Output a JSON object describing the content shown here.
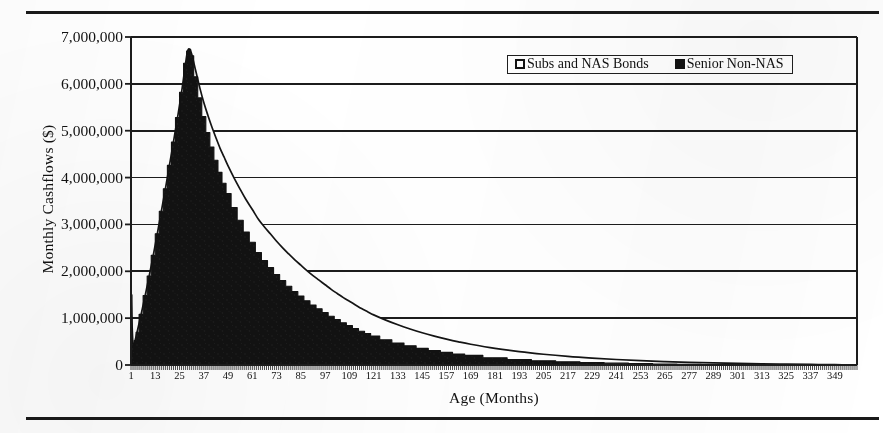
{
  "figure": {
    "rules": [
      "top-rule",
      "bottom-rule"
    ]
  },
  "legend": {
    "position": "inside-top-right",
    "entries": [
      {
        "label": "Subs and NAS Bonds",
        "swatch": "hollow-square-icon",
        "color": "#ffffff"
      },
      {
        "label": "Senior Non-NAS",
        "swatch": "filled-square-icon",
        "color": "#121212"
      }
    ]
  },
  "chart_data": {
    "type": "area",
    "stacked": true,
    "title": "",
    "subtitle": "",
    "xlabel": "Age (Months)",
    "ylabel": "Monthly Cashflows ($)",
    "xlim": [
      1,
      360
    ],
    "ylim": [
      0,
      7000000
    ],
    "grid": "horizontal",
    "legend_position": "top-right",
    "y_ticks": [
      0,
      1000000,
      2000000,
      3000000,
      4000000,
      5000000,
      6000000,
      7000000
    ],
    "y_tick_labels": [
      "0",
      "1,000,000",
      "2,000,000",
      "3,000,000",
      "4,000,000",
      "5,000,000",
      "6,000,000",
      "7,000,000"
    ],
    "x_ticks": [
      1,
      13,
      25,
      37,
      49,
      61,
      73,
      85,
      97,
      109,
      121,
      133,
      145,
      157,
      169,
      181,
      193,
      205,
      217,
      229,
      241,
      253,
      265,
      277,
      289,
      301,
      313,
      325,
      337,
      349
    ],
    "x_tick_labels": [
      "1",
      "13",
      "25",
      "37",
      "49",
      "61",
      "73",
      "85",
      "97",
      "109",
      "121",
      "133",
      "145",
      "157",
      "169",
      "181",
      "193",
      "205",
      "217",
      "229",
      "241",
      "253",
      "265",
      "277",
      "289",
      "301",
      "313",
      "325",
      "337",
      "349"
    ],
    "x_tick_step": 12,
    "x_minor_tick_step": 1,
    "series": [
      {
        "name": "Senior Non-NAS",
        "color": "#121212",
        "fill": "solid-black",
        "x": [
          1,
          2,
          3,
          4,
          6,
          8,
          10,
          12,
          14,
          16,
          18,
          20,
          22,
          24,
          26,
          28,
          29,
          30,
          31,
          33,
          35,
          37,
          39,
          41,
          43,
          45,
          47,
          49,
          52,
          55,
          58,
          61,
          64,
          67,
          70,
          73,
          76,
          79,
          82,
          85,
          88,
          91,
          94,
          97,
          100,
          103,
          106,
          109,
          112,
          115,
          118,
          121,
          127,
          133,
          139,
          145,
          151,
          157,
          163,
          169,
          181,
          193,
          205,
          217,
          229,
          241,
          253,
          265,
          277,
          289,
          301,
          313,
          325,
          337,
          349,
          360
        ],
        "y": [
          1500000,
          420000,
          520000,
          700000,
          1080000,
          1480000,
          1900000,
          2340000,
          2800000,
          3280000,
          3760000,
          4260000,
          4760000,
          5280000,
          5820000,
          6440000,
          6700000,
          6740000,
          6600000,
          6150000,
          5700000,
          5300000,
          4960000,
          4650000,
          4370000,
          4110000,
          3880000,
          3660000,
          3360000,
          3090000,
          2840000,
          2620000,
          2400000,
          2230000,
          2080000,
          1930000,
          1800000,
          1680000,
          1570000,
          1470000,
          1370000,
          1280000,
          1200000,
          1120000,
          1040000,
          970000,
          900000,
          840000,
          780000,
          720000,
          670000,
          620000,
          540000,
          470000,
          410000,
          355000,
          310000,
          270000,
          235000,
          205000,
          155000,
          118000,
          90000,
          68000,
          52000,
          39000,
          29000,
          22000,
          16000,
          12000,
          8500,
          6000,
          4000,
          2400,
          1200,
          0
        ]
      },
      {
        "name": "Subs and NAS Bonds",
        "color": "#ffffff",
        "fill": "hollow-white",
        "note": "stacked above Senior Non-NAS; outer boundary is the total cashflow curve",
        "x": [
          1,
          2,
          3,
          4,
          6,
          8,
          10,
          12,
          14,
          16,
          18,
          20,
          22,
          24,
          26,
          28,
          29,
          30,
          31,
          33,
          35,
          37,
          39,
          41,
          43,
          45,
          47,
          49,
          52,
          55,
          58,
          61,
          64,
          67,
          70,
          73,
          76,
          79,
          82,
          85,
          88,
          91,
          94,
          97,
          100,
          103,
          106,
          109,
          112,
          115,
          118,
          121,
          127,
          133,
          139,
          145,
          151,
          157,
          163,
          169,
          181,
          193,
          205,
          217,
          229,
          241,
          253,
          265,
          277,
          289,
          301,
          313,
          325,
          337,
          349,
          360
        ],
        "y": [
          0,
          0,
          0,
          0,
          0,
          0,
          0,
          0,
          0,
          0,
          0,
          0,
          0,
          0,
          0,
          0,
          0,
          0,
          40000,
          130000,
          220000,
          300000,
          370000,
          430000,
          480000,
          520000,
          560000,
          590000,
          630000,
          660000,
          680000,
          700000,
          710000,
          715000,
          715000,
          710000,
          700000,
          690000,
          675000,
          660000,
          645000,
          628000,
          610000,
          592000,
          574000,
          556000,
          538000,
          520000,
          502000,
          484000,
          467000,
          450000,
          418000,
          388000,
          359000,
          332000,
          306000,
          282000,
          259000,
          238000,
          200000,
          167000,
          139000,
          115000,
          95000,
          78000,
          63000,
          51000,
          41000,
          32000,
          25000,
          19000,
          14000,
          9500,
          5000,
          0
        ]
      }
    ],
    "annotations": [
      {
        "text": "peak total cashflow ≈ 6,740,000 at month 30"
      },
      {
        "text": "initial month-1 spike ≈ 1,500,000"
      }
    ]
  }
}
